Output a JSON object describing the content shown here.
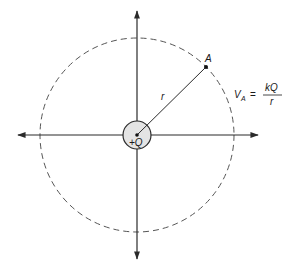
{
  "diagram": {
    "type": "electric-potential-point-charge",
    "charge": {
      "label": "+Q",
      "fill": "#e4e4e4"
    },
    "point": {
      "label": "A"
    },
    "radius": {
      "label": "r"
    },
    "formula": {
      "lhs_main": "V",
      "lhs_sub": "A",
      "equals": "=",
      "numerator": "kQ",
      "denominator": "r"
    },
    "colors": {
      "axis": "#2a2a2a",
      "dashed_circle": "#555555",
      "text": "#1a1a1a"
    }
  }
}
